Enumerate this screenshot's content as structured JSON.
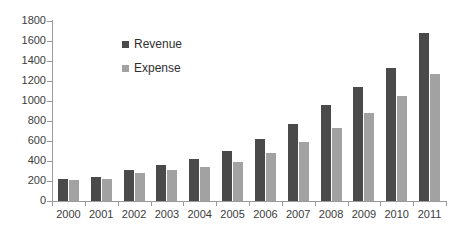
{
  "chart_data": {
    "type": "bar",
    "title": "",
    "subtitle": "",
    "xlabel": "",
    "ylabel": "",
    "categories": [
      "2000",
      "2001",
      "2002",
      "2003",
      "2004",
      "2005",
      "2006",
      "2007",
      "2008",
      "2009",
      "2010",
      "2011"
    ],
    "series": [
      {
        "name": "Revenue",
        "color": "#4a4a4a",
        "values": [
          225,
          245,
          310,
          365,
          425,
          500,
          620,
          775,
          965,
          1140,
          1330,
          1680
        ]
      },
      {
        "name": "Expense",
        "color": "#a2a2a2",
        "values": [
          210,
          225,
          280,
          310,
          340,
          395,
          480,
          590,
          730,
          880,
          1050,
          1270
        ]
      }
    ],
    "ylim": [
      0,
      1800
    ],
    "ytick_step": 200,
    "yticks": [
      0,
      200,
      400,
      600,
      800,
      1000,
      1200,
      1400,
      1600,
      1800
    ],
    "ytick_labels": [
      "0",
      "200",
      "400",
      "600",
      "800",
      "1000",
      "1200",
      "1400",
      "1600",
      "1800"
    ],
    "grid": false,
    "legend_position": "inside-upper-left",
    "legend_entries": [
      "Revenue",
      "Expense"
    ],
    "annotations": []
  }
}
